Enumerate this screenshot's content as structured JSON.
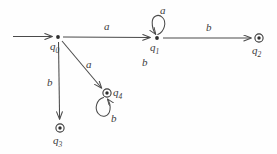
{
  "diagram": {
    "kind": "state-machine",
    "stroke_color": "#4a4a4a",
    "text_color": "#3c3c3c",
    "background_color": "#fefefe",
    "alphabet": [
      "a",
      "b"
    ]
  },
  "states": [
    {
      "id": "q0",
      "label": "q",
      "subscript": "0",
      "marker": "dot",
      "accepting": false,
      "start": true,
      "x": 58,
      "y": 37
    },
    {
      "id": "q1",
      "label": "q",
      "subscript": "1",
      "marker": "dot",
      "accepting": false,
      "start": false,
      "x": 157,
      "y": 38
    },
    {
      "id": "q2",
      "label": "q",
      "subscript": "2",
      "marker": "double-circle",
      "accepting": true,
      "start": false,
      "x": 259,
      "y": 38
    },
    {
      "id": "q3",
      "label": "q",
      "subscript": "3",
      "marker": "double-circle",
      "accepting": true,
      "start": false,
      "x": 60,
      "y": 128
    },
    {
      "id": "q4",
      "label": "q",
      "subscript": "4",
      "marker": "double-circle",
      "accepting": true,
      "start": false,
      "x": 107,
      "y": 93
    }
  ],
  "transitions": [
    {
      "id": "start-q0",
      "from": "",
      "to": "q0",
      "symbol": "",
      "shape": "start-arrow"
    },
    {
      "id": "q0-q1",
      "from": "q0",
      "to": "q1",
      "symbol": "a",
      "shape": "horizontal"
    },
    {
      "id": "q1-q2",
      "from": "q1",
      "to": "q2",
      "symbol": "b",
      "shape": "horizontal"
    },
    {
      "id": "q0-q3",
      "from": "q0",
      "to": "q3",
      "symbol": "b",
      "shape": "vertical"
    },
    {
      "id": "q0-q4",
      "from": "q0",
      "to": "q4",
      "symbol": "a",
      "shape": "diagonal"
    },
    {
      "id": "q1-q1",
      "from": "q1",
      "to": "q1",
      "symbol": "a",
      "shape": "self-loop-up"
    },
    {
      "id": "q4-q4",
      "from": "q4",
      "to": "q4",
      "symbol": "b",
      "shape": "self-loop-down"
    },
    {
      "id": "q1-stray",
      "from": "q1",
      "to": "",
      "symbol": "b",
      "shape": "label-only"
    }
  ],
  "labels": {
    "edge_q0_q1": "a",
    "edge_q1_q2": "b",
    "edge_q0_q3": "b",
    "edge_q0_q4": "a",
    "loop_q1": "a",
    "loop_q4": "b",
    "stray_b": "b",
    "state_q0": "q",
    "state_q0_sub": "0",
    "state_q1": "q",
    "state_q1_sub": "1",
    "state_q2": "q",
    "state_q2_sub": "2",
    "state_q3": "q",
    "state_q3_sub": "3",
    "state_q4": "q",
    "state_q4_sub": "4"
  }
}
